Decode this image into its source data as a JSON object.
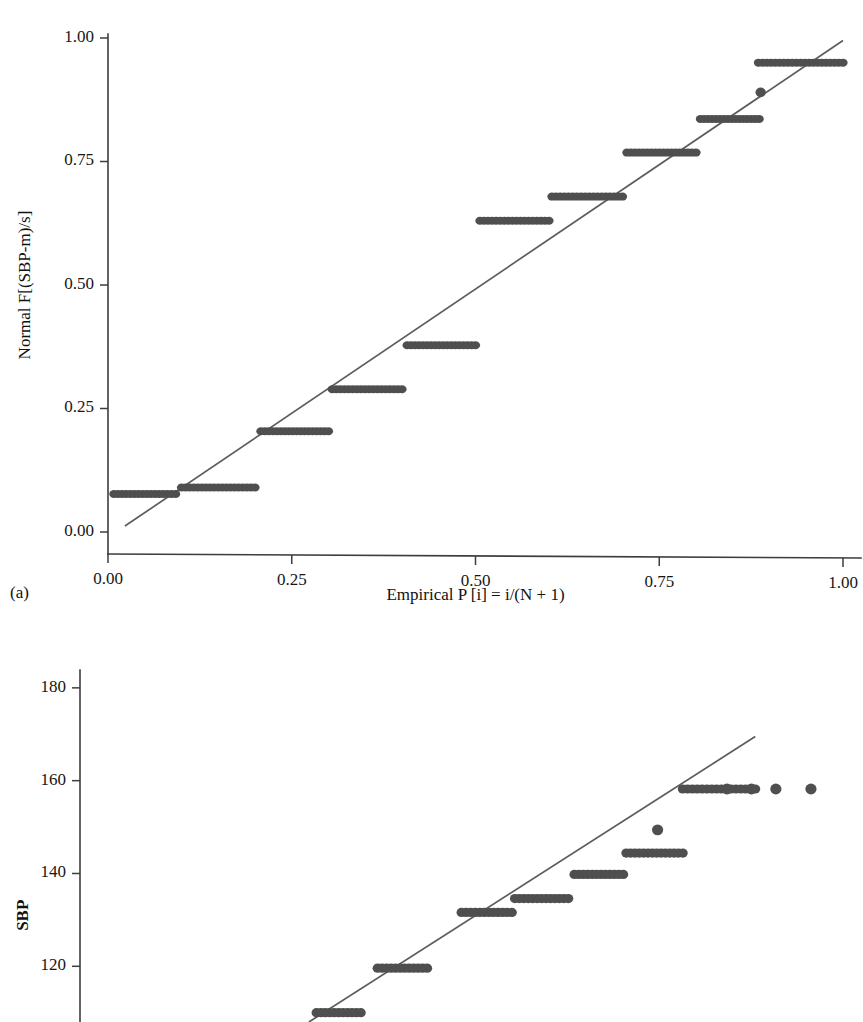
{
  "figure": {
    "panels": [
      {
        "caption": "(a)",
        "chart_key": 0
      },
      {
        "caption": "",
        "chart_key": 1
      }
    ]
  },
  "style": {
    "marker_color": "#4f4f4f",
    "line_color": "#5c5c5c",
    "axis_color": "#3d3d3d",
    "text_color": "#111111",
    "background": "#ffffff",
    "marker_radius_x": 4.6,
    "marker_radius_y": 4.0
  },
  "chart_data": [
    {
      "type": "scatter",
      "panel_label": "(a)",
      "title": "",
      "xlabel": "Empirical P [i] = i/(N + 1)",
      "ylabel": "Normal F[(SBP-m)/s]",
      "xlim": [
        0.0,
        1.0
      ],
      "ylim": [
        0.0,
        1.0
      ],
      "xticks": [
        0.0,
        0.25,
        0.5,
        0.75,
        1.0
      ],
      "xticklabels": [
        "0.00",
        "0.25",
        "0.50",
        "0.75",
        "1.00"
      ],
      "yticks": [
        0.0,
        0.25,
        0.5,
        0.75,
        1.0
      ],
      "yticklabels": [
        "0.00",
        "0.25",
        "0.50",
        "0.75",
        "1.00"
      ],
      "grid": false,
      "legend": "none",
      "reference_line": {
        "x": [
          0.023,
          1.0
        ],
        "y": [
          0.012,
          0.995
        ]
      },
      "point_bands": [
        {
          "y": 0.077,
          "x_start": 0.008,
          "x_end": 0.092,
          "count": 16
        },
        {
          "y": 0.09,
          "x_start": 0.1,
          "x_end": 0.2,
          "count": 19
        },
        {
          "y": 0.204,
          "x_start": 0.208,
          "x_end": 0.3,
          "count": 18
        },
        {
          "y": 0.289,
          "x_start": 0.305,
          "x_end": 0.4,
          "count": 18
        },
        {
          "y": 0.378,
          "x_start": 0.407,
          "x_end": 0.5,
          "count": 18
        },
        {
          "y": 0.63,
          "x_start": 0.506,
          "x_end": 0.6,
          "count": 18
        },
        {
          "y": 0.679,
          "x_start": 0.604,
          "x_end": 0.7,
          "count": 18
        },
        {
          "y": 0.768,
          "x_start": 0.706,
          "x_end": 0.8,
          "count": 18
        },
        {
          "y": 0.836,
          "x_start": 0.806,
          "x_end": 0.886,
          "count": 16
        },
        {
          "y": 0.95,
          "x_start": 0.885,
          "x_end": 1.0,
          "count": 21
        }
      ],
      "single_points": [
        {
          "x": 0.888,
          "y": 0.89
        }
      ]
    },
    {
      "type": "scatter",
      "panel_label": "",
      "title": "",
      "xlabel": "",
      "ylabel": "SBP",
      "xlim": [
        0.0,
        1.0
      ],
      "ylim": [
        108.0,
        186.0
      ],
      "xticks": [],
      "xticklabels": [],
      "yticks": [
        120,
        140,
        160,
        180
      ],
      "yticklabels": [
        "120",
        "140",
        "160",
        "180"
      ],
      "grid": false,
      "legend": "none",
      "reference_line": {
        "x": [
          0.3,
          0.885
        ],
        "y": [
          108.0,
          169.5
        ]
      },
      "point_bands": [
        {
          "y": 110.0,
          "x_start": 0.31,
          "x_end": 0.368,
          "count": 11
        },
        {
          "y": 119.6,
          "x_start": 0.39,
          "x_end": 0.455,
          "count": 12
        },
        {
          "y": 131.6,
          "x_start": 0.5,
          "x_end": 0.566,
          "count": 12
        },
        {
          "y": 134.6,
          "x_start": 0.57,
          "x_end": 0.64,
          "count": 13
        },
        {
          "y": 139.8,
          "x_start": 0.648,
          "x_end": 0.712,
          "count": 12
        },
        {
          "y": 144.4,
          "x_start": 0.716,
          "x_end": 0.79,
          "count": 14
        },
        {
          "y": 158.2,
          "x_start": 0.79,
          "x_end": 0.885,
          "count": 16
        }
      ],
      "single_points": [
        {
          "x": 0.757,
          "y": 149.4
        },
        {
          "x": 0.848,
          "y": 158.2
        },
        {
          "x": 0.88,
          "y": 158.2
        },
        {
          "x": 0.912,
          "y": 158.2
        },
        {
          "x": 0.958,
          "y": 158.2
        }
      ]
    }
  ]
}
